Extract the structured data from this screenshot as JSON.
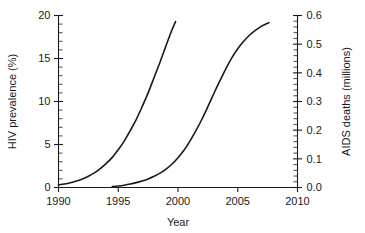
{
  "chart_data": {
    "type": "line",
    "title": "",
    "xlabel": "Year",
    "ylabel": "HIV prevalence (%)",
    "y2label": "AIDS deaths (millions)",
    "xlim": [
      1990,
      2010
    ],
    "ylim": [
      0,
      20
    ],
    "y2lim": [
      0.0,
      0.6
    ],
    "grid": false,
    "legend": "none",
    "x_ticks": [
      1990,
      1995,
      2000,
      2005,
      2010
    ],
    "x_tick_labels": [
      "1990",
      "1995",
      "2000",
      "2005",
      "2010"
    ],
    "y_ticks": [
      0,
      5,
      10,
      15,
      20
    ],
    "y_tick_labels": [
      "0",
      "5",
      "10",
      "15",
      "20"
    ],
    "y_minor_step": 1,
    "y2_ticks": [
      0.0,
      0.1,
      0.2,
      0.3,
      0.4,
      0.5,
      0.6
    ],
    "y2_tick_labels": [
      "0.0",
      "0.1",
      "0.2",
      "0.3",
      "0.4",
      "0.5",
      "0.6"
    ],
    "y2_minor_step": 0.02,
    "series": [
      {
        "name": "HIV prevalence",
        "axis": "left",
        "units": "%",
        "color": "#1a1a1a",
        "x": [
          1990.0,
          1990.5,
          1991.0,
          1991.5,
          1992.0,
          1992.5,
          1993.0,
          1993.5,
          1994.0,
          1994.5,
          1995.0,
          1995.5,
          1996.0,
          1996.5,
          1997.0,
          1997.5,
          1998.0,
          1998.5,
          1999.0,
          1999.4,
          1999.8
        ],
        "values": [
          0.3,
          0.4,
          0.55,
          0.75,
          1.0,
          1.3,
          1.7,
          2.2,
          2.8,
          3.5,
          4.4,
          5.4,
          6.6,
          7.9,
          9.4,
          11.0,
          12.8,
          14.6,
          16.5,
          18.0,
          19.3
        ]
      },
      {
        "name": "AIDS deaths",
        "axis": "right",
        "units": "millions",
        "color": "#1a1a1a",
        "x": [
          1994.5,
          1995.0,
          1995.5,
          1996.0,
          1996.5,
          1997.0,
          1997.5,
          1998.0,
          1998.5,
          1999.0,
          1999.5,
          2000.0,
          2000.5,
          2001.0,
          2001.5,
          2002.0,
          2002.5,
          2003.0,
          2003.5,
          2004.0,
          2004.5,
          2005.0,
          2005.5,
          2006.0,
          2006.5,
          2007.0,
          2007.6
        ],
        "values": [
          0.003,
          0.005,
          0.008,
          0.012,
          0.017,
          0.023,
          0.03,
          0.039,
          0.05,
          0.064,
          0.082,
          0.104,
          0.13,
          0.162,
          0.198,
          0.238,
          0.282,
          0.328,
          0.372,
          0.414,
          0.452,
          0.484,
          0.51,
          0.532,
          0.549,
          0.563,
          0.575
        ]
      }
    ]
  }
}
